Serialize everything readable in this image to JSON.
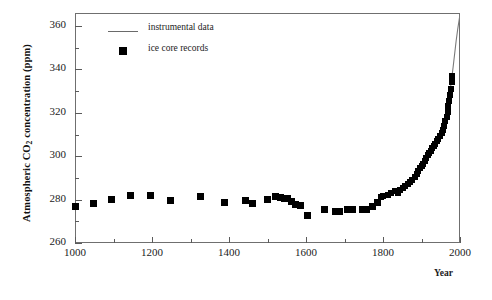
{
  "chart_data": {
    "type": "scatter",
    "title": "",
    "xlabel": "Year",
    "ylabel": "Atmospheric CO2 concentration (ppm)",
    "ylabel_parts": {
      "pre": "Atmospheric CO",
      "sub": "2",
      "post": " concentration (ppm)"
    },
    "xlim": [
      1000,
      2000
    ],
    "ylim": [
      260,
      366
    ],
    "x_ticks": [
      1000,
      1200,
      1400,
      1600,
      1800,
      2000
    ],
    "x_tick_labels": [
      "1000",
      "1200",
      "1400",
      "1600",
      "1800",
      "2000"
    ],
    "x_minor_ticks": [
      1100,
      1300,
      1500,
      1700,
      1900
    ],
    "y_ticks": [
      260,
      280,
      300,
      320,
      340,
      360
    ],
    "y_tick_labels": [
      "260",
      "280",
      "300",
      "320",
      "340",
      "360"
    ],
    "y_minor_ticks": [
      270,
      290,
      310,
      330,
      350
    ],
    "grid": false,
    "legend_position": "top-left",
    "legend": [
      {
        "label": "instrumental data",
        "marker": "line",
        "color": "#7a7a7a"
      },
      {
        "label": "ice core records",
        "marker": "square",
        "color": "#000000"
      }
    ],
    "series": [
      {
        "name": "ice core records",
        "type": "scatter",
        "marker": "square",
        "color": "#000000",
        "points": [
          [
            1002,
            277.0
          ],
          [
            1048,
            278.2
          ],
          [
            1095,
            280.1
          ],
          [
            1145,
            281.8
          ],
          [
            1196,
            281.7
          ],
          [
            1247,
            279.6
          ],
          [
            1327,
            281.4
          ],
          [
            1388,
            278.5
          ],
          [
            1444,
            279.6
          ],
          [
            1460,
            278.0
          ],
          [
            1500,
            280.2
          ],
          [
            1522,
            281.3
          ],
          [
            1533,
            281.0
          ],
          [
            1544,
            280.6
          ],
          [
            1552,
            280.4
          ],
          [
            1562,
            279.0
          ],
          [
            1572,
            277.6
          ],
          [
            1585,
            277.2
          ],
          [
            1604,
            272.5
          ],
          [
            1648,
            275.5
          ],
          [
            1676,
            274.6
          ],
          [
            1688,
            274.4
          ],
          [
            1709,
            275.6
          ],
          [
            1722,
            275.5
          ],
          [
            1748,
            275.4
          ],
          [
            1758,
            275.6
          ],
          [
            1772,
            276.6
          ],
          [
            1786,
            278.6
          ],
          [
            1795,
            281.4
          ],
          [
            1800,
            281.6
          ],
          [
            1812,
            282.0
          ],
          [
            1822,
            283.0
          ],
          [
            1832,
            284.0
          ],
          [
            1838,
            283.0
          ],
          [
            1845,
            284.6
          ],
          [
            1852,
            285.4
          ],
          [
            1858,
            286.2
          ],
          [
            1864,
            287.0
          ],
          [
            1870,
            288.0
          ],
          [
            1876,
            289.0
          ],
          [
            1882,
            290.2
          ],
          [
            1888,
            291.6
          ],
          [
            1892,
            293.0
          ],
          [
            1896,
            294.4
          ],
          [
            1900,
            295.6
          ],
          [
            1904,
            296.6
          ],
          [
            1908,
            297.6
          ],
          [
            1912,
            299.0
          ],
          [
            1916,
            300.4
          ],
          [
            1920,
            301.6
          ],
          [
            1924,
            302.6
          ],
          [
            1928,
            303.6
          ],
          [
            1932,
            304.6
          ],
          [
            1936,
            305.6
          ],
          [
            1940,
            306.8
          ],
          [
            1944,
            308.0
          ],
          [
            1948,
            309.2
          ],
          [
            1952,
            310.6
          ],
          [
            1956,
            312.0
          ],
          [
            1959,
            314.0
          ],
          [
            1962,
            316.0
          ],
          [
            1965,
            318.2
          ],
          [
            1968,
            320.6
          ],
          [
            1970,
            323.0
          ],
          [
            1972,
            325.6
          ],
          [
            1974,
            328.4
          ],
          [
            1976,
            331.2
          ],
          [
            1978,
            334.0
          ],
          [
            1980,
            337.0
          ]
        ]
      },
      {
        "name": "instrumental data",
        "type": "line",
        "color": "#7a7a7a",
        "points": [
          [
            1958,
            315.0
          ],
          [
            1962,
            317.6
          ],
          [
            1966,
            320.5
          ],
          [
            1970,
            325.0
          ],
          [
            1974,
            330.0
          ],
          [
            1978,
            335.0
          ],
          [
            1982,
            341.0
          ],
          [
            1986,
            347.0
          ],
          [
            1990,
            353.0
          ],
          [
            1994,
            358.5
          ],
          [
            1998,
            363.0
          ],
          [
            2000,
            365.5
          ]
        ]
      }
    ]
  }
}
